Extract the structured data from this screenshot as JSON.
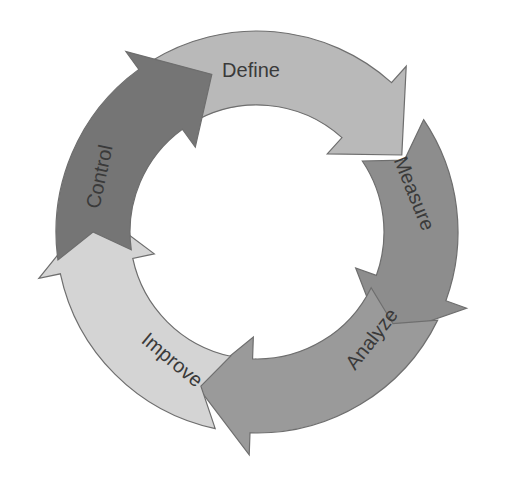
{
  "diagram": {
    "type": "cycle",
    "center": [
      257,
      232
    ],
    "outer_radius": 201,
    "inner_radius": 127,
    "steps": [
      {
        "id": "define",
        "label": "Define",
        "color": "#b9b9b9",
        "start_deg": -122,
        "end_deg": -28
      },
      {
        "id": "measure",
        "label": "Measure",
        "color": "#8d8d8d",
        "start_deg": -34,
        "end_deg": 40
      },
      {
        "id": "analyze",
        "label": "Analyze",
        "color": "#9a9a9a",
        "start_deg": 26,
        "end_deg": 112
      },
      {
        "id": "improve",
        "label": "Improve",
        "color": "#d4d4d4",
        "start_deg": 102,
        "end_deg": 188
      },
      {
        "id": "control",
        "label": "Control",
        "color": "#757575",
        "start_deg": 172,
        "end_deg": 254
      }
    ]
  }
}
